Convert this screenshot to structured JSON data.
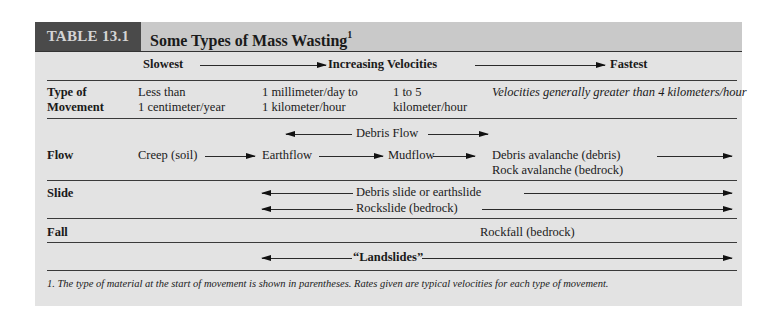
{
  "header": {
    "tag": "TABLE 13.1",
    "title": "Some Types of Mass Wasting",
    "title_footnote_mark": "1"
  },
  "velocity_scale": {
    "slowest": "Slowest",
    "middle": "Increasing Velocities",
    "fastest": "Fastest"
  },
  "rows": {
    "type_of_movement": {
      "label_line1": "Type of",
      "label_line2": "Movement",
      "col1_line1": "Less than",
      "col1_line2": "1 centimeter/year",
      "col2_line1": "1 millimeter/day to",
      "col2_line2": "1 kilometer/hour",
      "col3_line1": "1 to 5",
      "col3_line2": "kilometer/hour",
      "col4": "Velocities generally greater than 4 kilometers/hour"
    },
    "flow": {
      "label": "Flow",
      "debris_flow": "Debris Flow",
      "creep": "Creep (soil)",
      "earthflow": "Earthflow",
      "mudflow": "Mudflow",
      "debris_avalanche": "Debris avalanche (debris)",
      "rock_avalanche": "Rock avalanche (bedrock)"
    },
    "slide": {
      "label": "Slide",
      "debris_slide": "Debris slide or earthslide",
      "rockslide": "Rockslide (bedrock)"
    },
    "fall": {
      "label": "Fall",
      "rockfall": "Rockfall (bedrock)"
    },
    "landslides": {
      "label": "“Landslides”"
    }
  },
  "footnote": "1. The type of material at the start of movement is shown in parentheses. Rates given are typical velocities for each type of movement.",
  "colors": {
    "panel_bg": "#e3e3e3",
    "header_bg": "#c9c9c9",
    "tag_bg": "#4a4a4a",
    "tag_text": "#d4d4d4"
  }
}
